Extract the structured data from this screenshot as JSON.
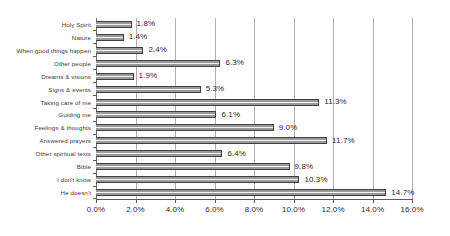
{
  "chart_data": {
    "type": "bar",
    "orientation": "horizontal",
    "title": "",
    "subtitle": "",
    "xlabel": "",
    "ylabel": "",
    "xlim": [
      0,
      16
    ],
    "xtick_step": 2,
    "grid": "vertical",
    "legend": "none",
    "value_suffix": "%",
    "categories": [
      "Holy Spirit",
      "Nature",
      "When good things happen",
      "Other people",
      "Dreams & visions",
      "Signs & events",
      "Taking care of me",
      "Guiding me",
      "Feelings & thoughts",
      "Answered prayers",
      "Other spiritual texts",
      "Bible",
      "I don't know",
      "He doesn't"
    ],
    "values": [
      1.8,
      1.4,
      2.4,
      6.3,
      1.9,
      5.3,
      11.3,
      6.1,
      9.0,
      11.7,
      6.4,
      9.8,
      10.3,
      14.7
    ],
    "data_labels": [
      "1.8%",
      "1.4%",
      "2.4%",
      "6.3%",
      "1.9%",
      "5.3%",
      "11.3%",
      "6.1%",
      "9.0%",
      "11.7%",
      "6.4%",
      "9.8%",
      "10.3%",
      "14.7%"
    ],
    "xticks": [
      0,
      2,
      4,
      6,
      8,
      10,
      12,
      14,
      16
    ],
    "xtick_labels": [
      "0.0%",
      "2.0%",
      "4.0%",
      "6.0%",
      "8.0%",
      "10.0%",
      "12.0%",
      "14.0%",
      "16.0%"
    ],
    "colors": {
      "bar_fill": "#9a9a9a",
      "bar_edge": "#3f3f3f",
      "gridline": "#b0b0b0",
      "axis": "#5a5a5a",
      "text": "#2b2b2b",
      "background": "#ffffff"
    }
  }
}
